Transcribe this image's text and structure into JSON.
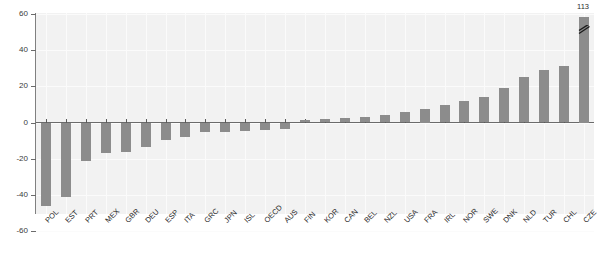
{
  "chart_data": {
    "type": "bar",
    "title": "",
    "subtitle": "",
    "xlabel": "",
    "ylabel": "",
    "ylim": [
      -60,
      60
    ],
    "yticks": [
      60,
      40,
      20,
      0,
      -20,
      -40,
      -60
    ],
    "ytick_labels": [
      "60",
      "40",
      "20",
      "0",
      "-20",
      "-40",
      "-60"
    ],
    "grid": true,
    "legend": "none",
    "bar_color": "#8c8c8c",
    "plot_background": "#f2f2f2",
    "categories": [
      "POL",
      "EST",
      "PRT",
      "MEX",
      "GBR",
      "DEU",
      "ESP",
      "ITA",
      "GRC",
      "JPN",
      "ISL",
      "OECD",
      "AUS",
      "FIN",
      "KOR",
      "CAN",
      "BEL",
      "NZL",
      "USA",
      "FRA",
      "IRL",
      "NOR",
      "SWE",
      "DNK",
      "NLD",
      "TUR",
      "CHL",
      "CZE"
    ],
    "values": [
      -46,
      -41,
      -21.5,
      -17,
      -16.5,
      -13.5,
      -9.5,
      -8,
      -5.5,
      -5,
      -4.5,
      -4,
      -3.5,
      1.5,
      2,
      2.5,
      3,
      4,
      6,
      7.5,
      9.5,
      12,
      14,
      19,
      25,
      29,
      31,
      113
    ],
    "annotations": [
      {
        "series_category": "CZE",
        "label": "113",
        "note": "bar truncated with axis break mark"
      }
    ]
  },
  "axis": {
    "y_top_label": "60",
    "y_bottom_label": "-60"
  }
}
